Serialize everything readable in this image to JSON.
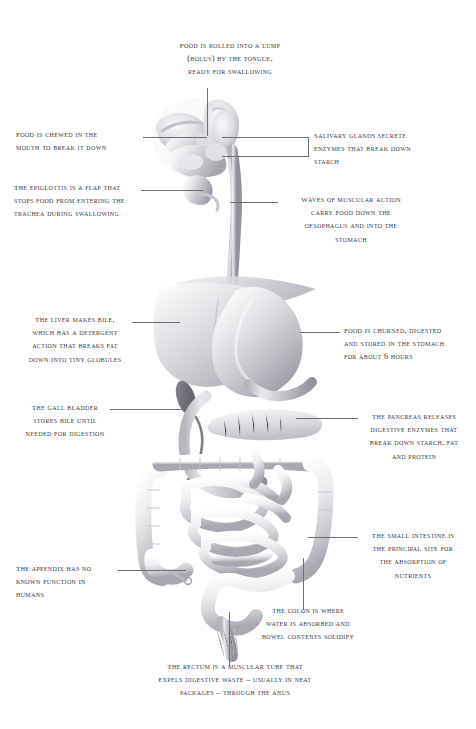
{
  "figure": {
    "type": "anatomical-illustration",
    "background_color": "#ffffff",
    "ink_color": "#3a3a46",
    "leader_color": "#6d6d78"
  },
  "annotations": [
    {
      "id": "bolus",
      "organ": "tongue",
      "align": "center",
      "text": "Food is rolled into a lump\n(bolus) by the tongue,\nready for swallowing"
    },
    {
      "id": "mouth",
      "organ": "mouth",
      "align": "left",
      "text": "Food is chewed in the\nmouth to break it down"
    },
    {
      "id": "salivary-glands",
      "organ": "salivary glands",
      "align": "left",
      "text": "Salivary glands secrete\nenzymes that break down\nstarch"
    },
    {
      "id": "epiglottis",
      "organ": "epiglottis",
      "align": "left",
      "text": "The epiglottis is a flap that\nstops food from entering the\ntrachea during swallowing"
    },
    {
      "id": "oesophagus",
      "organ": "oesophagus",
      "align": "center",
      "text": "Waves of muscular action\ncarry food down the\noesophagus and into the\nstomach"
    },
    {
      "id": "liver",
      "organ": "liver",
      "align": "center",
      "text": "The liver makes bile,\nwhich has a detergent\naction that breaks fat\ndown into tiny globules"
    },
    {
      "id": "stomach",
      "organ": "stomach",
      "align": "left",
      "text": "Food is churned, digested\nand stored in the stomach\nfor about 6 hours"
    },
    {
      "id": "gall-bladder",
      "organ": "gall bladder",
      "align": "center",
      "text": "The gall bladder\nstores bile until\nneeded for digestion"
    },
    {
      "id": "pancreas",
      "organ": "pancreas",
      "align": "center",
      "text": "The pancreas releases\ndigestive enzymes that\nbreak down starch, fat\nand protein"
    },
    {
      "id": "small-intestine",
      "organ": "small intestine",
      "align": "center",
      "text": "The small intestine is\nthe principal site for\nthe absorption of\nnutrients"
    },
    {
      "id": "appendix",
      "organ": "appendix",
      "align": "left",
      "text": "The appendix has no\nknown function in\nhumans"
    },
    {
      "id": "colon",
      "organ": "colon",
      "align": "center",
      "text": "The colon is where\nwater is absorbed and\nbowel contents solidify"
    },
    {
      "id": "rectum",
      "organ": "rectum",
      "align": "center",
      "text": "The rectum is a muscular tube that\nexpels digestive waste – usually in neat\npackages – through the anus"
    }
  ]
}
